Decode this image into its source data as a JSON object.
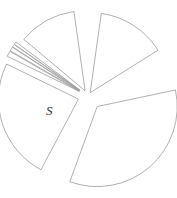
{
  "chart_data": {
    "type": "pie",
    "title": "",
    "style": "exploded outline pie",
    "center": [
      88,
      96
    ],
    "radius": 80,
    "start_angle_deg_clockwise_from_top": 0,
    "slices": [
      {
        "label": "",
        "start": 8,
        "end": 58,
        "value": 13.9,
        "explode": 4
      },
      {
        "label": "",
        "start": 78,
        "end": 200,
        "value": 33.9,
        "explode": 14
      },
      {
        "label": "S",
        "start": 208,
        "end": 296,
        "value": 24.4,
        "explode": 10
      },
      {
        "label": "",
        "start": 296,
        "end": 300,
        "value": 1.1,
        "explode": 10
      },
      {
        "label": "",
        "start": 300,
        "end": 303,
        "value": 0.8,
        "explode": 10
      },
      {
        "label": "",
        "start": 303,
        "end": 305,
        "value": 0.6,
        "explode": 10
      },
      {
        "label": "",
        "start": 305,
        "end": 307,
        "value": 0.6,
        "explode": 10
      },
      {
        "label": "",
        "start": 310,
        "end": 352,
        "value": 11.7,
        "explode": 6
      }
    ],
    "label_positions": [
      {
        "text": "S",
        "x": 46,
        "y": 115
      }
    ],
    "colors": {
      "stroke": "#9a9a9a",
      "fill": "#ffffff",
      "label": "#333333"
    },
    "legend": "none",
    "grid": false
  }
}
